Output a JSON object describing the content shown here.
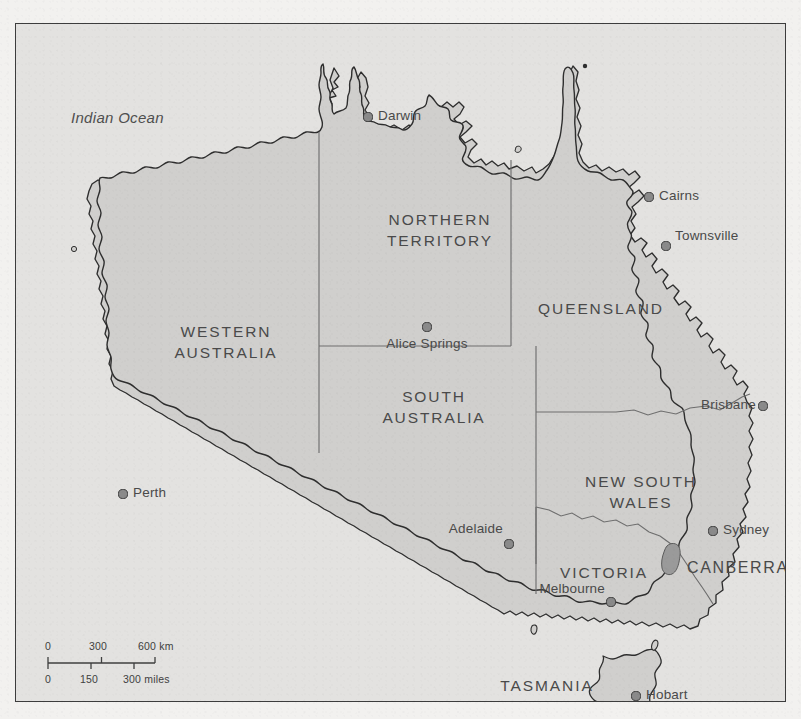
{
  "map": {
    "title": "Australia",
    "frame": {
      "border_color": "#3d3d3d"
    },
    "colors": {
      "ocean": "#e3e2e0",
      "land": "#d0cfcd",
      "coastline": "#2e2e2e",
      "state_border": "#6e6e6e",
      "label": "#4a4a4a",
      "city_dot": "#8a8a8a",
      "city_dot_stroke": "#3a3a3a",
      "act_fill": "#9a9a9a",
      "paper": "#f2f1ef"
    },
    "ocean_labels": [
      {
        "name": "indian-ocean",
        "text": "Indian Ocean",
        "x": 55,
        "y": 92
      }
    ],
    "states": [
      {
        "id": "western-australia",
        "text": "WESTERN\nAUSTRALIA",
        "x": 210,
        "y": 308
      },
      {
        "id": "northern-territory",
        "text": "NORTHERN\nTERRITORY",
        "x": 424,
        "y": 196
      },
      {
        "id": "south-australia",
        "text": "SOUTH\nAUSTRALIA",
        "x": 418,
        "y": 373
      },
      {
        "id": "queensland",
        "text": "QUEENSLAND",
        "x": 585,
        "y": 285
      },
      {
        "id": "new-south-wales",
        "text": "NEW SOUTH\nWALES",
        "x": 625,
        "y": 458
      },
      {
        "id": "victoria",
        "text": "VICTORIA",
        "x": 588,
        "y": 548
      },
      {
        "id": "tasmania",
        "text": "TASMANIA",
        "x": 531,
        "y": 661
      }
    ],
    "cities": [
      {
        "id": "darwin",
        "name": "Darwin",
        "x": 352,
        "y": 93,
        "label_x": 362,
        "label_y": 92,
        "anchor": "left",
        "capital": false
      },
      {
        "id": "cairns",
        "name": "Cairns",
        "x": 633,
        "y": 173,
        "label_x": 643,
        "label_y": 172,
        "anchor": "left",
        "capital": false
      },
      {
        "id": "townsville",
        "name": "Townsville",
        "x": 650,
        "y": 222,
        "label_x": 659,
        "label_y": 212,
        "anchor": "left",
        "capital": false
      },
      {
        "id": "alice-springs",
        "name": "Alice Springs",
        "x": 411,
        "y": 303,
        "label_x": 411,
        "label_y": 320,
        "anchor": "center",
        "capital": false
      },
      {
        "id": "brisbane",
        "name": "Brisbane",
        "x": 747,
        "y": 382,
        "label_x": 740,
        "label_y": 381,
        "anchor": "right",
        "capital": false
      },
      {
        "id": "perth",
        "name": "Perth",
        "x": 107,
        "y": 470,
        "label_x": 117,
        "label_y": 469,
        "anchor": "left",
        "capital": false
      },
      {
        "id": "sydney",
        "name": "Sydney",
        "x": 697,
        "y": 507,
        "label_x": 707,
        "label_y": 506,
        "anchor": "left",
        "capital": false
      },
      {
        "id": "adelaide",
        "name": "Adelaide",
        "x": 493,
        "y": 520,
        "label_x": 487,
        "label_y": 505,
        "anchor": "right",
        "capital": false
      },
      {
        "id": "melbourne",
        "name": "Melbourne",
        "x": 595,
        "y": 578,
        "label_x": 589,
        "label_y": 565,
        "anchor": "right",
        "capital": false
      },
      {
        "id": "hobart",
        "name": "Hobart",
        "x": 620,
        "y": 672,
        "label_x": 630,
        "label_y": 671,
        "anchor": "left",
        "capital": false
      }
    ],
    "capital": {
      "id": "canberra",
      "name": "CANBERRA",
      "x": 663,
      "y": 540,
      "label_x": 671,
      "label_y": 545
    },
    "scale_bar": {
      "name": "scale-bar",
      "km": {
        "ticks": [
          "0",
          "300",
          "600 km"
        ],
        "unit": "km"
      },
      "miles": {
        "ticks": [
          "0",
          "150",
          "300 miles"
        ],
        "unit": "miles"
      }
    }
  }
}
